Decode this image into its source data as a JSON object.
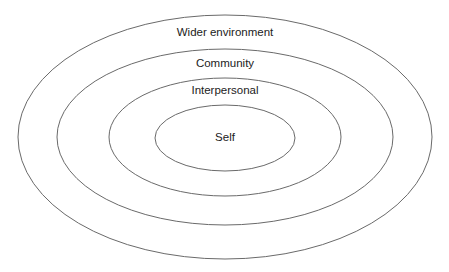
{
  "diagram": {
    "type": "concentric-ellipses",
    "rings": [
      {
        "label": "Wider environment",
        "cx": 225,
        "cy": 137,
        "rx": 207,
        "ry": 122,
        "label_y": 36
      },
      {
        "label": "Community",
        "cx": 225,
        "cy": 137,
        "rx": 168,
        "ry": 88,
        "label_y": 67
      },
      {
        "label": "Interpersonal",
        "cx": 225,
        "cy": 137,
        "rx": 116,
        "ry": 59,
        "label_y": 94
      },
      {
        "label": "Self",
        "cx": 225,
        "cy": 138,
        "rx": 70,
        "ry": 33,
        "label_y": 141
      }
    ],
    "stroke_color": "#6a6a6a",
    "text_color": "#222222"
  }
}
